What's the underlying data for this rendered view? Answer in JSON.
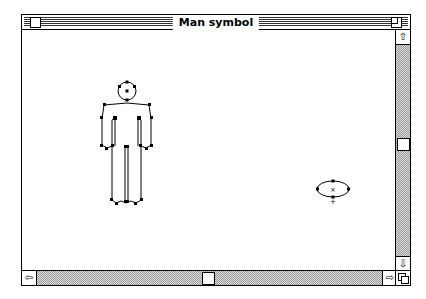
{
  "window": {
    "title": "Man symbol"
  },
  "canvas": {
    "shapes": [
      {
        "type": "man-figure",
        "label": "man-symbol"
      },
      {
        "type": "ellipse",
        "label": "selected-ellipse",
        "center_mark": "×"
      }
    ]
  },
  "scrollbars": {
    "vertical": {
      "up_arrow": "⇧",
      "down_arrow": "⇩"
    },
    "horizontal": {
      "left_arrow": "⇦",
      "right_arrow": "⇨"
    }
  }
}
